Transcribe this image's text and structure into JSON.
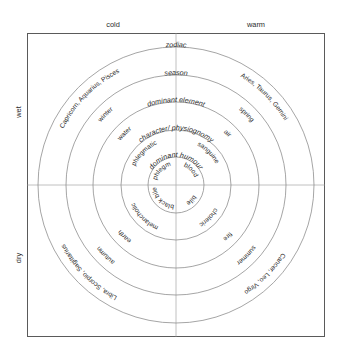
{
  "diagram": {
    "axis_labels": {
      "top_left": "cold",
      "top_right": "warm",
      "left_top": "wet",
      "left_bottom": "dry"
    },
    "ring_titles": [
      "dominant humour",
      "character/ physiognomy",
      "dominant element",
      "season",
      "zodiac"
    ],
    "quadrants": [
      {
        "name": "sanguine-quadrant",
        "position": "upper-right",
        "qualities": [
          "warm",
          "wet"
        ],
        "values": [
          "blood",
          "sanguine",
          "air",
          "spring",
          "Aries, Taurus, Gemini"
        ]
      },
      {
        "name": "choleric-quadrant",
        "position": "lower-right",
        "qualities": [
          "warm",
          "dry"
        ],
        "values": [
          "bile",
          "choleric",
          "fire",
          "summer",
          "Cancer, Leo, Virgo"
        ]
      },
      {
        "name": "melancholic-quadrant",
        "position": "lower-left",
        "qualities": [
          "cold",
          "dry"
        ],
        "values": [
          "black bile",
          "melancholic",
          "earth",
          "autumn",
          "Libra, Scorpio, Sagittarius"
        ]
      },
      {
        "name": "phlegmatic-quadrant",
        "position": "upper-left",
        "qualities": [
          "cold",
          "wet"
        ],
        "values": [
          "phlegm",
          "phlegmatic",
          "water",
          "winter",
          "Capricorn, Aquarius, Pisces"
        ]
      }
    ],
    "colors": {
      "frame": "#5a5a5a",
      "ring": "#8e8e8e",
      "axis": "#b0b0b0",
      "text": "#2b2b2b",
      "background": "#ffffff"
    }
  }
}
